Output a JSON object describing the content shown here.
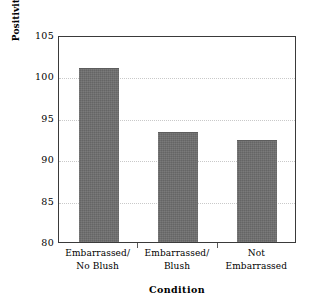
{
  "chart_data": {
    "type": "bar",
    "title": "",
    "xlabel": "Condition",
    "ylabel": "Positivity of Self-Presentation",
    "categories": [
      "Embarrassed/ No Blush",
      "Embarrassed/ Blush",
      "Not Embarrassed"
    ],
    "category_lines": [
      [
        "Embarrassed/",
        "No Blush"
      ],
      [
        "Embarrassed/",
        "Blush"
      ],
      [
        "Not",
        "Embarrassed"
      ]
    ],
    "values": [
      101.0,
      93.3,
      92.3
    ],
    "ylim": [
      80,
      105
    ],
    "yticks": [
      105,
      100,
      95,
      90,
      85,
      80
    ],
    "ytick_labels": [
      "105",
      "100",
      "95",
      "90",
      "85",
      "80"
    ],
    "grid": "horizontal-dotted",
    "legend": "none",
    "bar_color": "#6e6e6e",
    "frame_color": "#3a3a3a",
    "grid_color": "#c9c9c9"
  }
}
